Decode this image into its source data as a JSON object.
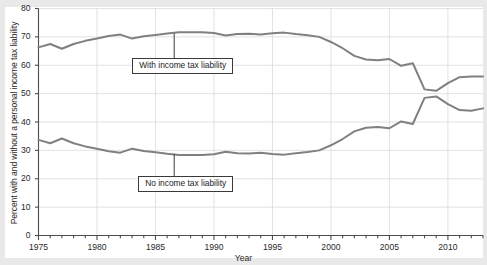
{
  "chart_data": {
    "type": "line",
    "title": "",
    "subtitle": "",
    "xlabel": "Year",
    "ylabel": "Percent with and without a personal income tax liability",
    "xlim": [
      1975,
      2013
    ],
    "ylim": [
      0,
      80
    ],
    "grid": true,
    "legend_position": "inline-annotations",
    "ytick_labels": [
      "0",
      "10",
      "20",
      "30",
      "40",
      "50",
      "60",
      "70",
      "80"
    ],
    "ytick_values": [
      0,
      10,
      20,
      30,
      40,
      50,
      60,
      70,
      80
    ],
    "xtick_labels": [
      "1975",
      "1980",
      "1985",
      "1990",
      "1995",
      "2000",
      "2005",
      "2010"
    ],
    "xtick_values": [
      1975,
      1980,
      1985,
      1990,
      1995,
      2000,
      2005,
      2010
    ],
    "xminor_step": 1,
    "line_color": "#808080",
    "grid_color": "#d9d9e2",
    "axis_color": "#4d4d4d",
    "x": [
      1975,
      1976,
      1977,
      1978,
      1979,
      1980,
      1981,
      1982,
      1983,
      1984,
      1985,
      1986,
      1987,
      1988,
      1989,
      1990,
      1991,
      1992,
      1993,
      1994,
      1995,
      1996,
      1997,
      1998,
      1999,
      2000,
      2001,
      2002,
      2003,
      2004,
      2005,
      2006,
      2007,
      2008,
      2009,
      2010,
      2011,
      2012,
      2013
    ],
    "series": [
      {
        "name": "With income tax liability",
        "annotation": "With income tax liability",
        "values": [
          66.3,
          67.5,
          65.8,
          67.5,
          68.6,
          69.4,
          70.3,
          70.8,
          69.4,
          70.2,
          70.7,
          71.2,
          71.6,
          71.6,
          71.6,
          71.4,
          70.5,
          71.0,
          71.1,
          70.8,
          71.3,
          71.5,
          71.0,
          70.6,
          70.0,
          68.2,
          66.0,
          63.3,
          62.0,
          61.8,
          62.2,
          59.8,
          60.7,
          51.5,
          51.0,
          53.7,
          55.8,
          56.0,
          56.0
        ]
      },
      {
        "name": "No income tax liability",
        "annotation": "No income tax liability",
        "values": [
          33.7,
          32.5,
          34.2,
          32.5,
          31.4,
          30.6,
          29.7,
          29.2,
          30.6,
          29.8,
          29.3,
          28.8,
          28.4,
          28.4,
          28.4,
          28.6,
          29.5,
          29.0,
          28.9,
          29.2,
          28.7,
          28.5,
          29.0,
          29.4,
          30.0,
          31.8,
          34.0,
          36.7,
          38.0,
          38.2,
          37.8,
          40.2,
          39.3,
          48.5,
          49.0,
          46.3,
          44.2,
          44.0,
          44.8
        ]
      }
    ],
    "annotations": [
      {
        "text": "With income tax liability",
        "anchor_year": 1986.6,
        "anchor_value": 71.2,
        "box_top_percent": 62.5
      },
      {
        "text": "No income tax liability",
        "anchor_year": 1986.6,
        "anchor_value": 28.8,
        "box_top_percent": 21.0
      }
    ]
  }
}
